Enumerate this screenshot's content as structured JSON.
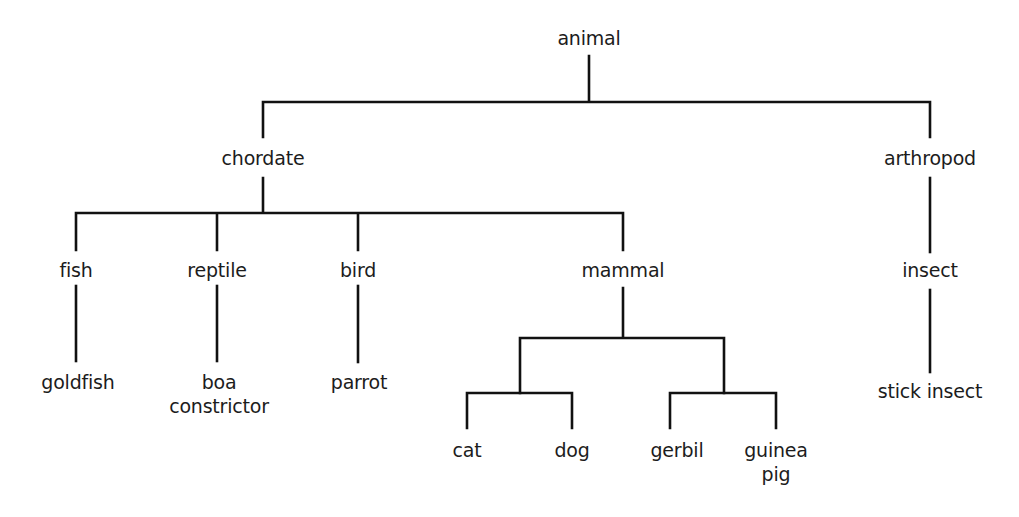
{
  "diagram": {
    "type": "tree",
    "title": "",
    "nodes": [
      {
        "id": "animal",
        "label": "animal",
        "x": 589,
        "y": 26
      },
      {
        "id": "chordate",
        "label": "chordate",
        "x": 263,
        "y": 146
      },
      {
        "id": "arthropod",
        "label": "arthropod",
        "x": 930,
        "y": 146
      },
      {
        "id": "fish",
        "label": "fish",
        "x": 76,
        "y": 258
      },
      {
        "id": "reptile",
        "label": "reptile",
        "x": 217,
        "y": 258
      },
      {
        "id": "bird",
        "label": "bird",
        "x": 358,
        "y": 258
      },
      {
        "id": "mammal",
        "label": "mammal",
        "x": 623,
        "y": 258
      },
      {
        "id": "insect",
        "label": "insect",
        "x": 930,
        "y": 258
      },
      {
        "id": "goldfish",
        "label": "goldfish",
        "x": 78,
        "y": 370
      },
      {
        "id": "boa_constrictor",
        "label": "boa",
        "label2": "constrictor",
        "x": 219,
        "y": 370
      },
      {
        "id": "parrot",
        "label": "parrot",
        "x": 359,
        "y": 370
      },
      {
        "id": "stick_insect",
        "label": "stick insect",
        "x": 930,
        "y": 379
      },
      {
        "id": "cat",
        "label": "cat",
        "x": 467,
        "y": 438
      },
      {
        "id": "dog",
        "label": "dog",
        "x": 572,
        "y": 438
      },
      {
        "id": "gerbil",
        "label": "gerbil",
        "x": 677,
        "y": 438
      },
      {
        "id": "guinea_pig",
        "label": "guinea",
        "label2": "pig",
        "x": 776,
        "y": 438
      }
    ],
    "edges": [
      [
        "animal",
        "chordate"
      ],
      [
        "animal",
        "arthropod"
      ],
      [
        "chordate",
        "fish"
      ],
      [
        "chordate",
        "reptile"
      ],
      [
        "chordate",
        "bird"
      ],
      [
        "chordate",
        "mammal"
      ],
      [
        "arthropod",
        "insect"
      ],
      [
        "fish",
        "goldfish"
      ],
      [
        "reptile",
        "boa_constrictor"
      ],
      [
        "bird",
        "parrot"
      ],
      [
        "mammal",
        "cat"
      ],
      [
        "mammal",
        "dog"
      ],
      [
        "mammal",
        "gerbil"
      ],
      [
        "mammal",
        "guinea_pig"
      ],
      [
        "insect",
        "stick_insect"
      ]
    ],
    "line_color": "#111111",
    "text_color": "#1c1c1c",
    "background": "#ffffff"
  }
}
